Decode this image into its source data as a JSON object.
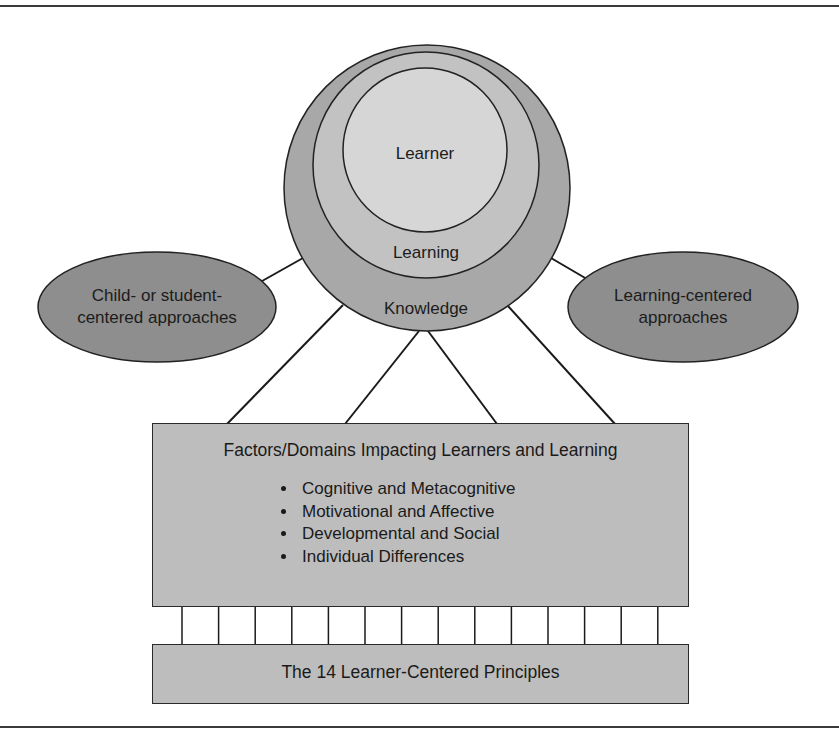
{
  "diagram": {
    "circles": {
      "inner": {
        "label": "Learner",
        "fill": "#d6d6d6"
      },
      "middle": {
        "label": "Learning",
        "fill": "#c2c2c2"
      },
      "outer": {
        "label": "Knowledge",
        "fill": "#a8a8a8"
      }
    },
    "left_ellipse": {
      "line1": "Child- or student-",
      "line2": "centered approaches",
      "fill": "#8e8e8e"
    },
    "right_ellipse": {
      "line1": "Learning-centered",
      "line2": "approaches",
      "fill": "#8e8e8e"
    },
    "factors_box": {
      "title": "Factors/Domains Impacting Learners and Learning",
      "items": [
        "Cognitive and Metacognitive",
        "Motivational and Affective",
        "Developmental and Social",
        "Individual Differences"
      ],
      "fill": "#bdbdbd"
    },
    "connector_posts": 14,
    "principles_box": {
      "label": "The 14 Learner-Centered Principles",
      "fill": "#bdbdbd"
    }
  }
}
